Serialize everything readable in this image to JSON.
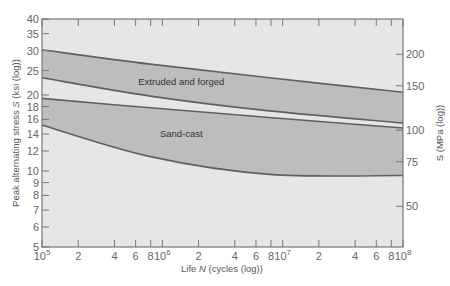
{
  "chart_data": {
    "type": "area",
    "title": "",
    "xlabel": "Life N (cycles (log))",
    "ylabel": "Peak alternating stress S (ksi (log))",
    "ylabel_right": "S (MPa (log))",
    "x_scale": "log",
    "y_scale": "log",
    "xlim": [
      100000,
      100000000
    ],
    "ylim": [
      5,
      40
    ],
    "x_ticks": [
      {
        "v": 100000,
        "label": "10^5",
        "base": "10",
        "exp": "5"
      },
      {
        "v": 200000,
        "label": "2"
      },
      {
        "v": 400000,
        "label": "4"
      },
      {
        "v": 600000,
        "label": "6"
      },
      {
        "v": 800000,
        "label": "8"
      },
      {
        "v": 1000000,
        "label": "10^6",
        "base": "10",
        "exp": "6"
      },
      {
        "v": 2000000,
        "label": "2"
      },
      {
        "v": 4000000,
        "label": "4"
      },
      {
        "v": 6000000,
        "label": "6"
      },
      {
        "v": 8000000,
        "label": "8"
      },
      {
        "v": 10000000,
        "label": "10^7",
        "base": "10",
        "exp": "7"
      },
      {
        "v": 20000000,
        "label": "2"
      },
      {
        "v": 40000000,
        "label": "4"
      },
      {
        "v": 60000000,
        "label": "6"
      },
      {
        "v": 80000000,
        "label": "8"
      },
      {
        "v": 100000000,
        "label": "10^8",
        "base": "10",
        "exp": "8"
      }
    ],
    "y_ticks_left": [
      5,
      6,
      7,
      8,
      9,
      10,
      12,
      14,
      16,
      18,
      20,
      25,
      30,
      35,
      40
    ],
    "y_ticks_right_mpa": [
      50,
      75,
      100,
      150,
      200
    ],
    "grid": false,
    "series": [
      {
        "name": "Extruded and forged",
        "type": "band",
        "fill": "#b9b9b9",
        "x": [
          100000,
          794000,
          7760000,
          100000000
        ],
        "upper": [
          30.2,
          26.5,
          23.4,
          20.5
        ],
        "lower": [
          23.4,
          19.8,
          17.3,
          15.5
        ]
      },
      {
        "name": "Sand-cast",
        "type": "band",
        "fill": "#b9b9b9",
        "x": [
          100000,
          794000,
          7760000,
          100000000
        ],
        "upper": [
          19.4,
          17.8,
          16.3,
          14.8
        ],
        "lower": [
          15.2,
          11.4,
          9.7,
          9.6
        ]
      }
    ],
    "annotations": [
      {
        "text": "Extruded and forged",
        "x": 1000000,
        "y": 22.5
      },
      {
        "text": "Sand-cast",
        "x": 1000000,
        "y": 14.0
      }
    ],
    "colors": {
      "plot_background": "#e6e6e6",
      "band_fill": "#bdbdbd",
      "line": "#5f5f6a",
      "axis": "#777777"
    }
  }
}
